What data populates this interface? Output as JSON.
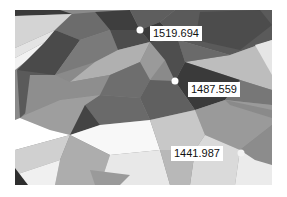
{
  "map": {
    "type": "tin-surface",
    "colors": {
      "background": "#ffffff",
      "label_bg": "#ffffff",
      "label_text": "#111111",
      "point": "#ffffff"
    }
  },
  "points": [
    {
      "label": "1519.694",
      "x": 140,
      "y": 30
    },
    {
      "label": "1487.559",
      "x": 175,
      "y": 81
    },
    {
      "label": "1441.987",
      "x": 241,
      "y": 153
    }
  ]
}
